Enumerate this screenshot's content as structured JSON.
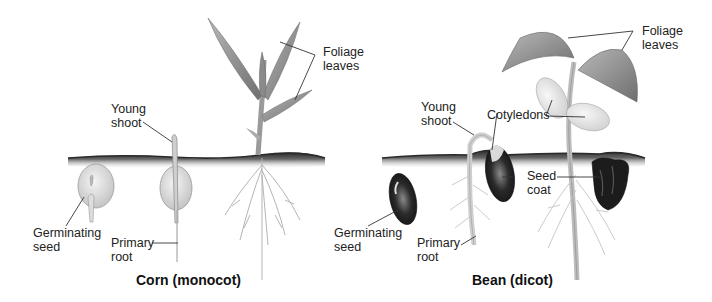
{
  "figure": {
    "panels": [
      {
        "id": "corn",
        "caption": "Corn (monocot)",
        "labels": {
          "germinating_seed": "Germinating\nseed",
          "young_shoot": "Young\nshoot",
          "primary_root": "Primary\nroot",
          "foliage_leaves": "Foliage\nleaves"
        }
      },
      {
        "id": "bean",
        "caption": "Bean (dicot)",
        "labels": {
          "germinating_seed": "Germinating\nseed",
          "young_shoot": "Young\nshoot",
          "primary_root": "Primary\nroot",
          "cotyledons": "Cotyledons",
          "seed_coat": "Seed\ncoat",
          "foliage_leaves": "Foliage\nleaves"
        }
      }
    ],
    "colors": {
      "soil": "#3a3a3a",
      "plant_light": "#d8d8d8",
      "plant_mid": "#9a9a9a",
      "seed_coat_dark": "#1c1c1c",
      "leader_line": "#333333"
    }
  }
}
